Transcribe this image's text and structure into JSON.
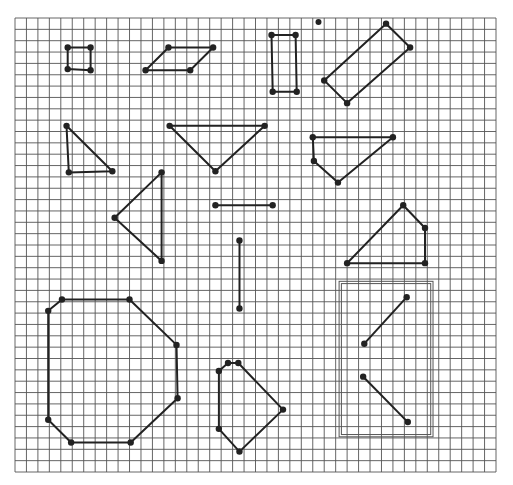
{
  "grid": {
    "columns": 42,
    "rows": 40
  },
  "colors": {
    "grid": "#555555",
    "ink": "#222222",
    "frame": "#555555",
    "paper": "#ffffff"
  },
  "shapes": [
    {
      "name": "small-square",
      "closed": true,
      "points": [
        [
          4.6,
          2.6
        ],
        [
          6.6,
          2.6
        ],
        [
          6.6,
          4.6
        ],
        [
          4.6,
          4.5
        ]
      ]
    },
    {
      "name": "parallelogram",
      "closed": true,
      "points": [
        [
          11.4,
          2.6
        ],
        [
          17.3,
          2.6
        ],
        [
          15.3,
          4.6
        ],
        [
          11.4,
          4.6
        ],
        [
          11.4,
          4.6
        ]
      ],
      "override": [
        [
          13.4,
          2.6
        ],
        [
          17.3,
          2.6
        ],
        [
          15.3,
          4.6
        ],
        [
          11.4,
          4.6
        ]
      ]
    },
    {
      "name": "tall-rectangle",
      "closed": true,
      "points": [
        [
          22.4,
          1.5
        ],
        [
          24.5,
          1.5
        ],
        [
          24.6,
          6.5
        ],
        [
          22.5,
          6.5
        ]
      ]
    },
    {
      "name": "tilted-rectangle",
      "closed": true,
      "points": [
        [
          32.4,
          0.5
        ],
        [
          34.5,
          2.6
        ],
        [
          29.0,
          7.5
        ],
        [
          27.0,
          5.5
        ]
      ]
    },
    {
      "name": "right-triangle",
      "closed": true,
      "points": [
        [
          4.5,
          9.5
        ],
        [
          8.5,
          13.5
        ],
        [
          4.7,
          13.6
        ]
      ]
    },
    {
      "name": "inverted-triangle",
      "closed": true,
      "points": [
        [
          13.5,
          9.5
        ],
        [
          21.8,
          9.5
        ],
        [
          17.5,
          13.5
        ]
      ]
    },
    {
      "name": "pentagon-upper-right",
      "closed": true,
      "points": [
        [
          26.0,
          10.5
        ],
        [
          33.0,
          10.5
        ],
        [
          28.2,
          14.5
        ],
        [
          26.1,
          12.6
        ]
      ]
    },
    {
      "name": "left-pointing-triangle",
      "closed": true,
      "points": [
        [
          12.8,
          13.6
        ],
        [
          12.8,
          21.4
        ],
        [
          8.7,
          17.6
        ]
      ]
    },
    {
      "name": "horizontal-segment",
      "closed": false,
      "points": [
        [
          17.5,
          16.5
        ],
        [
          22.5,
          16.5
        ]
      ]
    },
    {
      "name": "vertical-segment",
      "closed": false,
      "points": [
        [
          19.6,
          19.6
        ],
        [
          19.6,
          25.6
        ]
      ]
    },
    {
      "name": "quadrilateral-right",
      "closed": true,
      "points": [
        [
          29.0,
          21.6
        ],
        [
          33.9,
          16.5
        ],
        [
          35.8,
          18.5
        ],
        [
          35.8,
          21.6
        ]
      ]
    },
    {
      "name": "octagon",
      "closed": true,
      "points": [
        [
          2.9,
          25.8
        ],
        [
          4.1,
          24.8
        ],
        [
          10.0,
          24.8
        ],
        [
          14.1,
          28.8
        ],
        [
          14.2,
          33.5
        ],
        [
          10.1,
          37.4
        ],
        [
          4.9,
          37.4
        ],
        [
          2.9,
          35.4
        ]
      ]
    },
    {
      "name": "pentagon-bottom",
      "closed": true,
      "points": [
        [
          17.8,
          31.1
        ],
        [
          18.6,
          30.4
        ],
        [
          19.5,
          30.4
        ],
        [
          23.4,
          34.5
        ],
        [
          19.6,
          38.2
        ],
        [
          17.8,
          36.2
        ]
      ]
    },
    {
      "name": "diagonal-segment-up",
      "closed": false,
      "points": [
        [
          30.5,
          28.7
        ],
        [
          34.2,
          24.6
        ]
      ]
    },
    {
      "name": "diagonal-segment-down",
      "closed": false,
      "points": [
        [
          30.4,
          31.6
        ],
        [
          34.3,
          35.6
        ]
      ]
    }
  ],
  "stray_dots": [
    {
      "name": "stray-dot",
      "point": [
        26.5,
        0.35
      ]
    }
  ],
  "frame": {
    "name": "double-frame",
    "outer": [
      28.3,
      23.2,
      36.5,
      36.9
    ],
    "inner": [
      28.5,
      23.4,
      36.3,
      36.7
    ]
  }
}
